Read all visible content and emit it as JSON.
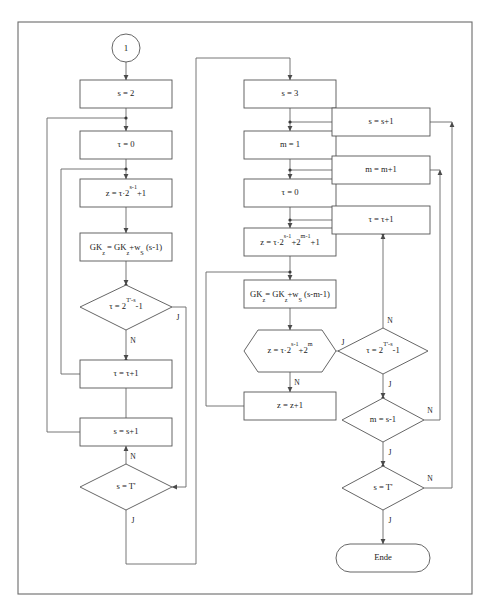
{
  "diagram": {
    "language": "de",
    "branch_yes": "J",
    "branch_no": "N",
    "colors": {
      "background": "#ffffff",
      "stroke": "#555555",
      "frame": "#6b6b6b",
      "text": "#1a1a1a"
    }
  },
  "connector": {
    "start_label": "1"
  },
  "nodes": {
    "left_col": {
      "set_s_2": "s = 2",
      "set_tau_0": "τ = 0",
      "set_z": "z = τ·2",
      "set_z_exp": "s-1",
      "set_z_tail": "+1",
      "gk_update": "GK",
      "gk_sub": "z",
      "gk_eq": " = GK",
      "gk_sub2": "z",
      "gk_rest": "+w",
      "gk_sub3": "S",
      "gk_tail": " (s-1)",
      "dec_tau": "τ = 2",
      "dec_tau_exp": "T'-s",
      "dec_tau_tail": "-1",
      "inc_tau": "τ = τ+1",
      "inc_s": "s = s+1",
      "dec_s": "s = T'"
    },
    "mid_col": {
      "set_s_3": "s = 3",
      "set_m_1": "m = 1",
      "set_tau_0": "τ = 0",
      "set_z": "z = τ·2",
      "set_z_exp1": "s-1",
      "set_z_mid": "+2",
      "set_z_exp2": "m-1",
      "set_z_tail": "+1",
      "gk_update": "GK",
      "gk_sub": "z",
      "gk_eq": "= GK",
      "gk_sub2": "z",
      "gk_rest": "+w",
      "gk_sub3": "S",
      "gk_tail": " (s-m-1)",
      "hex_z": "z = τ·2",
      "hex_z_exp1": "s-1",
      "hex_z_mid": "+2",
      "hex_z_exp2": "m",
      "inc_z": "z = z+1"
    },
    "right_col": {
      "inc_s": "s = s+1",
      "inc_m": "m = m+1",
      "inc_tau": "τ = τ+1",
      "dec_tau": "τ = 2",
      "dec_tau_exp": "T'-s",
      "dec_tau_tail": "-1",
      "dec_m": "m = s-1",
      "dec_s": "s = T'",
      "end": "Ende"
    }
  }
}
